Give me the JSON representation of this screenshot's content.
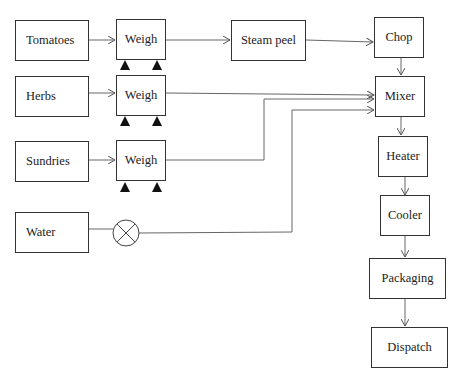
{
  "diagram": {
    "type": "process-flow",
    "title": "",
    "nodes": {
      "tomatoes": "Tomatoes",
      "herbs": "Herbs",
      "sundries": "Sundries",
      "water": "Water",
      "weigh1": "Weigh",
      "weigh2": "Weigh",
      "weigh3": "Weigh",
      "steam_peel": "Steam peel",
      "chop": "Chop",
      "mixer": "Mixer",
      "heater": "Heater",
      "cooler": "Cooler",
      "packaging": "Packaging",
      "dispatch": "Dispatch"
    },
    "valve": "water-valve",
    "edges": [
      [
        "Tomatoes",
        "Weigh"
      ],
      [
        "Weigh",
        "Steam peel"
      ],
      [
        "Steam peel",
        "Chop"
      ],
      [
        "Chop",
        "Mixer"
      ],
      [
        "Herbs",
        "Weigh"
      ],
      [
        "Weigh",
        "Mixer"
      ],
      [
        "Sundries",
        "Weigh"
      ],
      [
        "Weigh",
        "Mixer"
      ],
      [
        "Water",
        "valve"
      ],
      [
        "valve",
        "Mixer"
      ],
      [
        "Mixer",
        "Heater"
      ],
      [
        "Heater",
        "Cooler"
      ],
      [
        "Cooler",
        "Packaging"
      ],
      [
        "Packaging",
        "Dispatch"
      ]
    ],
    "colors": {
      "line": "#555555",
      "border": "#333333",
      "text": "#222222"
    }
  }
}
